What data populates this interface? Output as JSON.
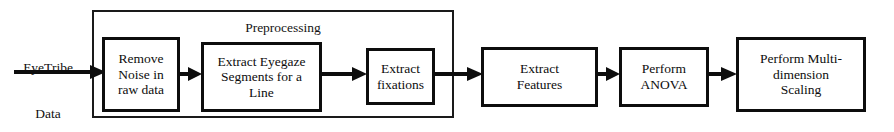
{
  "figure": {
    "type": "flowchart",
    "orientation": "left-to-right",
    "background_color": "#ffffff",
    "line_color": "#0d0d0d"
  },
  "source": {
    "name": "eyetribe-data-input",
    "text": "EyeTribe\nData\n(30 Hz)",
    "line1": "EyeTribe",
    "line2": "Data",
    "line3": "(30 Hz)"
  },
  "group": {
    "name": "preprocessing-group",
    "label": "Preprocessing",
    "contains": [
      "remove-noise",
      "extract-eyegaze-segments",
      "extract-fixations"
    ]
  },
  "nodes": [
    {
      "id": "remove-noise",
      "label": "Remove\nNoise in\nraw data"
    },
    {
      "id": "extract-eyegaze-segments",
      "label": "Extract Eyegaze\nSegments for a\nLine"
    },
    {
      "id": "extract-fixations",
      "label": "Extract\nfixations"
    },
    {
      "id": "extract-features",
      "label": "Extract\nFeatures"
    },
    {
      "id": "perform-anova",
      "label": "Perform\nANOVA"
    },
    {
      "id": "perform-mds",
      "label": "Perform Multi-\ndimension\nScaling"
    }
  ],
  "arrows": [
    {
      "id": "arrow-source-to-remove-noise",
      "from": "eyetribe-data-input",
      "to": "remove-noise"
    },
    {
      "id": "arrow-remove-noise-to-segments",
      "from": "remove-noise",
      "to": "extract-eyegaze-segments"
    },
    {
      "id": "arrow-segments-to-fixations",
      "from": "extract-eyegaze-segments",
      "to": "extract-fixations"
    },
    {
      "id": "arrow-fixations-to-features",
      "from": "extract-fixations",
      "to": "extract-features"
    },
    {
      "id": "arrow-features-to-anova",
      "from": "extract-features",
      "to": "perform-anova"
    },
    {
      "id": "arrow-anova-to-mds",
      "from": "perform-anova",
      "to": "perform-mds"
    }
  ]
}
